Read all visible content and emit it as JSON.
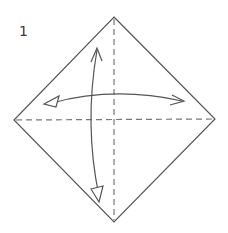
{
  "diagram": {
    "step_number": "1",
    "colors": {
      "background": "#ffffff",
      "outline": "#555555",
      "crease": "#777777",
      "arrow": "#555555",
      "text": "#3a3a3a"
    },
    "shape": {
      "type": "square-as-diamond",
      "vertices": {
        "top": [
          114,
          17
        ],
        "right": [
          215,
          119
        ],
        "bottom": [
          114,
          222
        ],
        "left": [
          14,
          120
        ]
      }
    },
    "creases": [
      {
        "name": "vertical-diagonal",
        "type": "valley-fold-dashed",
        "from": [
          114,
          17
        ],
        "to": [
          114,
          222
        ]
      },
      {
        "name": "horizontal-diagonal",
        "type": "valley-fold-dashed",
        "from": [
          14,
          120
        ],
        "to": [
          215,
          119
        ]
      }
    ],
    "arrows": [
      {
        "name": "horizontal-fold-unfold-arrow",
        "meaning": "fold and unfold left-right",
        "left_head": "hollow-triangle",
        "right_head": "open-v"
      },
      {
        "name": "vertical-fold-unfold-arrow",
        "meaning": "fold and unfold top-bottom",
        "top_head": "open-v",
        "bottom_head": "hollow-triangle"
      }
    ]
  }
}
